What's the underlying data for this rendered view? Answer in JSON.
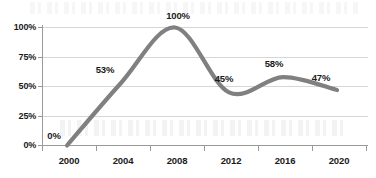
{
  "chart_data": {
    "type": "line",
    "title": "",
    "subtitle": "",
    "xlabel": "",
    "ylabel": "",
    "categories": [
      "2000",
      "2004",
      "2008",
      "2012",
      "2016",
      "2020"
    ],
    "x": [
      2000,
      2004,
      2008,
      2012,
      2016,
      2020
    ],
    "values": [
      0,
      53,
      100,
      45,
      58,
      47
    ],
    "point_labels": [
      "0%",
      "53%",
      "100%",
      "45%",
      "58%",
      "47%"
    ],
    "series": [
      {
        "name": "",
        "values": [
          0,
          53,
          100,
          45,
          58,
          47
        ],
        "color": "#808080",
        "smooth": true
      }
    ],
    "ylim": [
      0,
      100
    ],
    "yticks": [
      0,
      25,
      50,
      75,
      100
    ],
    "ytick_labels": [
      "0%",
      "25%",
      "50%",
      "75%",
      "100%"
    ],
    "xtick_labels": [
      "2000",
      "2004",
      "2008",
      "2012",
      "2016",
      "2020"
    ],
    "grid": true,
    "grid_axis": "y",
    "legend": false,
    "legend_position": "none",
    "data_labels": true
  },
  "style": {
    "line_color": "#808080",
    "grid_color": "#d6d6d6",
    "axis_color": "#9a9a9a",
    "text_color": "#1a1a1a",
    "background": "#ffffff"
  }
}
